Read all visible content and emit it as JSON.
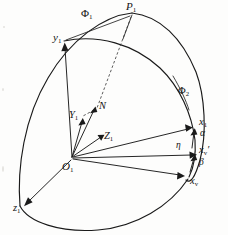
{
  "figure": {
    "background_color": "#fdfdfc",
    "ink_color": "#1a1a1a"
  },
  "labels": {
    "phi1": {
      "text": "Φ",
      "sub": "1",
      "name": "phi-1"
    },
    "phi2": {
      "text": "Φ",
      "sub": "2",
      "name": "phi-2"
    },
    "p1": {
      "text": "P",
      "sub": "1",
      "name": "point-p1"
    },
    "y1_lower": {
      "text": "y",
      "sub": "1",
      "name": "axis-y1"
    },
    "Y1_upper": {
      "text": "Y",
      "sub": "1",
      "name": "axis-Y1"
    },
    "N": {
      "text": "N",
      "sub": "",
      "name": "point-n"
    },
    "Z1": {
      "text": "Z",
      "sub": "1",
      "name": "axis-Z1"
    },
    "O1": {
      "text": "O",
      "sub": "1",
      "name": "origin-o1"
    },
    "z1": {
      "text": "z",
      "sub": "1",
      "name": "axis-z1"
    },
    "x1": {
      "text": "x",
      "sub": "1",
      "name": "axis-x1"
    },
    "alpha": {
      "text": "α",
      "sub": "",
      "name": "angle-alpha"
    },
    "eta": {
      "text": "η",
      "sub": "",
      "name": "angle-eta"
    },
    "xv_prime": {
      "text": "x",
      "sub": "v",
      "prime": "′",
      "name": "axis-xv-prime"
    },
    "beta": {
      "text": "β",
      "sub": "",
      "name": "angle-beta"
    },
    "xv": {
      "text": "x",
      "sub": "v",
      "name": "axis-xv"
    }
  },
  "points": {
    "P1": [
      132,
      14
    ],
    "y1": [
      64,
      40
    ],
    "N": [
      95,
      112
    ],
    "Y1": [
      81,
      118
    ],
    "Z1": [
      104,
      137
    ],
    "O1": [
      72,
      158
    ],
    "z1": [
      22,
      208
    ],
    "x1": [
      196,
      124
    ],
    "xv_prime": [
      201,
      152
    ],
    "xv": [
      188,
      175
    ],
    "phi1": [
      88,
      17
    ],
    "phi2": [
      183,
      93
    ]
  }
}
